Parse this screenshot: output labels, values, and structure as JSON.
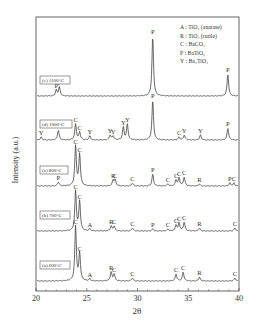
{
  "chart_data": {
    "type": "line",
    "title": "",
    "xlabel": "2θ",
    "ylabel": "Intensity (a.u.)",
    "xlim": [
      20,
      40
    ],
    "x_ticks": [
      20,
      25,
      30,
      35,
      40
    ],
    "grid": false,
    "legend": {
      "position": "top-right",
      "entries": [
        {
          "key": "A",
          "label": "TiO₂ (anatase)"
        },
        {
          "key": "R",
          "label": "TiO₂ (rutile)"
        },
        {
          "key": "C",
          "label": "BaCO₃"
        },
        {
          "key": "P",
          "label": "BaTiO₃"
        },
        {
          "key": "Y",
          "label": "Ba₂TiO₄"
        }
      ]
    },
    "series": [
      {
        "name": "(e) 1100°C",
        "peaks": [
          {
            "x": 22.0,
            "h": 6,
            "label": "P"
          },
          {
            "x": 22.3,
            "h": 9,
            "label": "P"
          },
          {
            "x": 31.5,
            "h": 60,
            "label": "P"
          },
          {
            "x": 38.9,
            "h": 22,
            "label": "P"
          }
        ]
      },
      {
        "name": "(d) 1000°C",
        "peaks": [
          {
            "x": 20.5,
            "h": 3,
            "label": "Y"
          },
          {
            "x": 22.2,
            "h": 10,
            "label": "P"
          },
          {
            "x": 23.9,
            "h": 16,
            "label": "C"
          },
          {
            "x": 24.3,
            "h": 8,
            "label": "C"
          },
          {
            "x": 25.3,
            "h": 4,
            "label": "Y"
          },
          {
            "x": 27.3,
            "h": 5,
            "label": "Y"
          },
          {
            "x": 27.6,
            "h": 4,
            "label": "Y"
          },
          {
            "x": 28.6,
            "h": 13,
            "label": "Y"
          },
          {
            "x": 29.0,
            "h": 16,
            "label": "Y"
          },
          {
            "x": 31.5,
            "h": 40,
            "label": "P"
          },
          {
            "x": 34.1,
            "h": 3,
            "label": "C"
          },
          {
            "x": 34.6,
            "h": 5,
            "label": "Y"
          },
          {
            "x": 36.2,
            "h": 5,
            "label": "Y"
          },
          {
            "x": 38.9,
            "h": 12,
            "label": "P"
          }
        ]
      },
      {
        "name": "(c) 800°C",
        "peaks": [
          {
            "x": 22.2,
            "h": 4,
            "label": "P"
          },
          {
            "x": 23.9,
            "h": 40,
            "label": "C"
          },
          {
            "x": 24.3,
            "h": 32,
            "label": "C"
          },
          {
            "x": 27.6,
            "h": 6,
            "label": "R"
          },
          {
            "x": 27.8,
            "h": 6,
            "label": "C"
          },
          {
            "x": 29.5,
            "h": 3,
            "label": "C"
          },
          {
            "x": 31.5,
            "h": 12,
            "label": "P"
          },
          {
            "x": 33.0,
            "h": 2,
            "label": "C"
          },
          {
            "x": 33.8,
            "h": 6,
            "label": "C"
          },
          {
            "x": 34.1,
            "h": 8,
            "label": "C"
          },
          {
            "x": 34.6,
            "h": 9,
            "label": "C"
          },
          {
            "x": 36.1,
            "h": 2,
            "label": "R"
          },
          {
            "x": 39.1,
            "h": 3,
            "label": "P"
          },
          {
            "x": 39.5,
            "h": 3,
            "label": "C"
          }
        ]
      },
      {
        "name": "(b) 700°C",
        "peaks": [
          {
            "x": 23.9,
            "h": 40,
            "label": "C"
          },
          {
            "x": 24.3,
            "h": 30,
            "label": "C"
          },
          {
            "x": 25.3,
            "h": 2,
            "label": "A"
          },
          {
            "x": 27.4,
            "h": 5,
            "label": "R"
          },
          {
            "x": 27.7,
            "h": 5,
            "label": "C"
          },
          {
            "x": 29.5,
            "h": 3,
            "label": "C"
          },
          {
            "x": 31.5,
            "h": 2,
            "label": "P"
          },
          {
            "x": 33.0,
            "h": 2,
            "label": "C"
          },
          {
            "x": 33.8,
            "h": 6,
            "label": "C"
          },
          {
            "x": 34.1,
            "h": 8,
            "label": "C"
          },
          {
            "x": 34.6,
            "h": 9,
            "label": "C"
          },
          {
            "x": 36.1,
            "h": 3,
            "label": "R"
          },
          {
            "x": 39.6,
            "h": 3,
            "label": "C"
          }
        ]
      },
      {
        "name": "(a) 600°C",
        "peaks": [
          {
            "x": 23.9,
            "h": 55,
            "label": "C"
          },
          {
            "x": 24.3,
            "h": 28,
            "label": "C"
          },
          {
            "x": 25.3,
            "h": 2,
            "label": "A"
          },
          {
            "x": 27.4,
            "h": 9,
            "label": "R"
          },
          {
            "x": 27.7,
            "h": 7,
            "label": "C"
          },
          {
            "x": 29.5,
            "h": 3,
            "label": "C"
          },
          {
            "x": 33.8,
            "h": 7,
            "label": "C"
          },
          {
            "x": 34.5,
            "h": 9,
            "label": "C"
          },
          {
            "x": 36.1,
            "h": 4,
            "label": "R"
          },
          {
            "x": 39.6,
            "h": 3,
            "label": "C"
          }
        ]
      }
    ]
  },
  "layout": {
    "plot": {
      "left": 36,
      "right": 239,
      "top": 17,
      "bottom": 291
    },
    "baselines": [
      96,
      140,
      186,
      231,
      281
    ],
    "colors": {
      "line": "#444444",
      "frame": "#555555",
      "text": "#333333"
    }
  }
}
